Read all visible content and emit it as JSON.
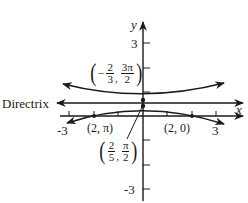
{
  "diagram": {
    "type": "polar conic graph (hyperbola)",
    "axes": {
      "x_label": "x",
      "y_label": "y",
      "x_ticks": [
        "-3",
        "3"
      ],
      "y_ticks": [
        "3",
        "-3"
      ],
      "x_range": [
        -3,
        3
      ],
      "y_range": [
        -3,
        3
      ]
    },
    "directrix": {
      "label": "Directrix"
    },
    "points": [
      {
        "name": "upper-vertex",
        "label_prefix": "−",
        "r_num": "2",
        "r_den": "3",
        "theta_num": "3π",
        "theta_den": "2"
      },
      {
        "name": "lower-vertex",
        "label_prefix": "",
        "r_num": "2",
        "r_den": "5",
        "theta_num": "π",
        "theta_den": "2"
      },
      {
        "name": "left-point",
        "label": "(2, π)"
      },
      {
        "name": "right-point",
        "label": "(2, 0)"
      }
    ],
    "colors": {
      "ink": "#1a1a1a",
      "background": "#ffffff"
    }
  }
}
